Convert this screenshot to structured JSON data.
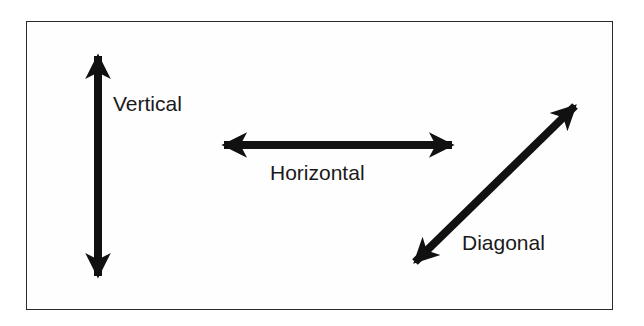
{
  "diagram": {
    "arrows": [
      {
        "id": "vertical",
        "label": "Vertical",
        "from": [
          98,
          38
        ],
        "to": [
          98,
          294
        ]
      },
      {
        "id": "horizontal",
        "label": "Horizontal",
        "from": [
          206,
          145
        ],
        "to": [
          470,
          145
        ]
      },
      {
        "id": "diagonal",
        "label": "Diagonal",
        "from": [
          402,
          275
        ],
        "to": [
          588,
          93
        ]
      }
    ],
    "labels": {
      "vertical": "Vertical",
      "horizontal": "Horizontal",
      "diagonal": "Diagonal"
    },
    "colors": {
      "arrow": "#111111",
      "border": "#2a2a2a",
      "text": "#1a1a1a"
    }
  }
}
